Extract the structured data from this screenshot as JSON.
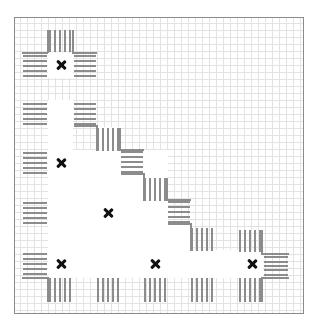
{
  "diagram": {
    "type": "staircase-grid-layout",
    "frame": {
      "x": 14,
      "y": 17,
      "width": 290,
      "height": 297,
      "border_color": "#8a8a8a"
    },
    "grid_color": "#e3e3e3",
    "hatch_color": "#8c8c8c",
    "marker_color": "#111111",
    "marker_icon": "cross-icon",
    "markers": [
      {
        "id": "m1",
        "x": 61,
        "y": 65
      },
      {
        "id": "m2",
        "x": 61,
        "y": 163
      },
      {
        "id": "m3",
        "x": 108,
        "y": 213
      },
      {
        "id": "m4",
        "x": 61,
        "y": 264
      },
      {
        "id": "m5",
        "x": 155,
        "y": 264
      },
      {
        "id": "m6",
        "x": 252,
        "y": 264
      }
    ],
    "hatches": [
      {
        "orient": "v",
        "x": 48,
        "y": 30,
        "w": 24,
        "h": 22
      },
      {
        "orient": "h",
        "x": 23,
        "y": 53,
        "w": 24,
        "h": 25
      },
      {
        "orient": "h",
        "x": 74,
        "y": 53,
        "w": 22,
        "h": 25
      },
      {
        "orient": "h",
        "x": 23,
        "y": 101,
        "w": 24,
        "h": 25
      },
      {
        "orient": "h",
        "x": 74,
        "y": 101,
        "w": 22,
        "h": 25
      },
      {
        "orient": "v",
        "x": 96,
        "y": 128,
        "w": 24,
        "h": 23
      },
      {
        "orient": "h",
        "x": 121,
        "y": 150,
        "w": 22,
        "h": 24
      },
      {
        "orient": "h",
        "x": 23,
        "y": 151,
        "w": 24,
        "h": 24
      },
      {
        "orient": "v",
        "x": 143,
        "y": 178,
        "w": 24,
        "h": 23
      },
      {
        "orient": "h",
        "x": 168,
        "y": 200,
        "w": 22,
        "h": 24
      },
      {
        "orient": "h",
        "x": 23,
        "y": 201,
        "w": 24,
        "h": 24
      },
      {
        "orient": "v",
        "x": 190,
        "y": 228,
        "w": 24,
        "h": 23
      },
      {
        "orient": "v",
        "x": 238,
        "y": 230,
        "w": 24,
        "h": 22
      },
      {
        "orient": "h",
        "x": 264,
        "y": 255,
        "w": 24,
        "h": 22
      },
      {
        "orient": "h",
        "x": 23,
        "y": 251,
        "w": 24,
        "h": 26
      },
      {
        "orient": "v",
        "x": 48,
        "y": 278,
        "w": 24,
        "h": 24
      },
      {
        "orient": "v",
        "x": 96,
        "y": 278,
        "w": 24,
        "h": 24
      },
      {
        "orient": "v",
        "x": 143,
        "y": 278,
        "w": 24,
        "h": 24
      },
      {
        "orient": "v",
        "x": 190,
        "y": 278,
        "w": 24,
        "h": 24
      },
      {
        "orient": "v",
        "x": 238,
        "y": 278,
        "w": 24,
        "h": 24
      }
    ],
    "edges": [
      {
        "x": 47,
        "y": 30,
        "w": 2,
        "h": 23
      },
      {
        "x": 22,
        "y": 52,
        "w": 26,
        "h": 2
      },
      {
        "x": 72,
        "y": 30,
        "w": 2,
        "h": 23
      },
      {
        "x": 72,
        "y": 52,
        "w": 25,
        "h": 2
      },
      {
        "x": 74,
        "y": 125,
        "w": 23,
        "h": 2
      },
      {
        "x": 96,
        "y": 125,
        "w": 2,
        "h": 26
      },
      {
        "x": 119,
        "y": 128,
        "w": 2,
        "h": 23
      },
      {
        "x": 119,
        "y": 149,
        "w": 25,
        "h": 2
      },
      {
        "x": 121,
        "y": 173,
        "w": 23,
        "h": 2
      },
      {
        "x": 143,
        "y": 173,
        "w": 2,
        "h": 28
      },
      {
        "x": 166,
        "y": 178,
        "w": 2,
        "h": 23
      },
      {
        "x": 166,
        "y": 199,
        "w": 25,
        "h": 2
      },
      {
        "x": 168,
        "y": 223,
        "w": 23,
        "h": 2
      },
      {
        "x": 190,
        "y": 223,
        "w": 2,
        "h": 28
      },
      {
        "x": 261,
        "y": 230,
        "w": 2,
        "h": 24
      },
      {
        "x": 261,
        "y": 253,
        "w": 28,
        "h": 2
      },
      {
        "x": 262,
        "y": 277,
        "w": 27,
        "h": 2
      },
      {
        "x": 261,
        "y": 277,
        "w": 2,
        "h": 25
      },
      {
        "x": 22,
        "y": 277,
        "w": 27,
        "h": 2
      },
      {
        "x": 47,
        "y": 277,
        "w": 2,
        "h": 25
      }
    ],
    "whiteouts": [
      {
        "x": 48,
        "y": 53,
        "w": 25,
        "h": 25
      },
      {
        "x": 48,
        "y": 100,
        "w": 25,
        "h": 78
      },
      {
        "x": 48,
        "y": 150,
        "w": 120,
        "h": 128
      },
      {
        "x": 97,
        "y": 127,
        "w": 22,
        "h": 24
      },
      {
        "x": 122,
        "y": 174,
        "w": 22,
        "h": 104
      },
      {
        "x": 168,
        "y": 225,
        "w": 22,
        "h": 53
      },
      {
        "x": 214,
        "y": 250,
        "w": 48,
        "h": 28
      },
      {
        "x": 48,
        "y": 250,
        "w": 215,
        "h": 28
      }
    ],
    "grid_x": [
      20,
      27,
      34,
      41,
      48,
      55,
      62,
      69,
      76,
      83,
      90,
      97,
      104,
      111,
      118,
      125,
      132,
      139,
      146,
      153,
      160,
      167,
      174,
      181,
      188,
      195,
      202,
      209,
      216,
      223,
      230,
      237,
      244,
      251,
      258,
      265,
      272,
      279,
      286,
      293,
      300
    ],
    "grid_y": [
      23,
      30,
      37,
      44,
      51,
      58,
      65,
      72,
      79,
      86,
      93,
      100,
      107,
      114,
      121,
      128,
      135,
      142,
      149,
      156,
      163,
      170,
      177,
      184,
      191,
      198,
      205,
      212,
      219,
      226,
      233,
      240,
      247,
      254,
      261,
      268,
      275,
      282,
      289,
      296,
      303,
      310
    ]
  }
}
